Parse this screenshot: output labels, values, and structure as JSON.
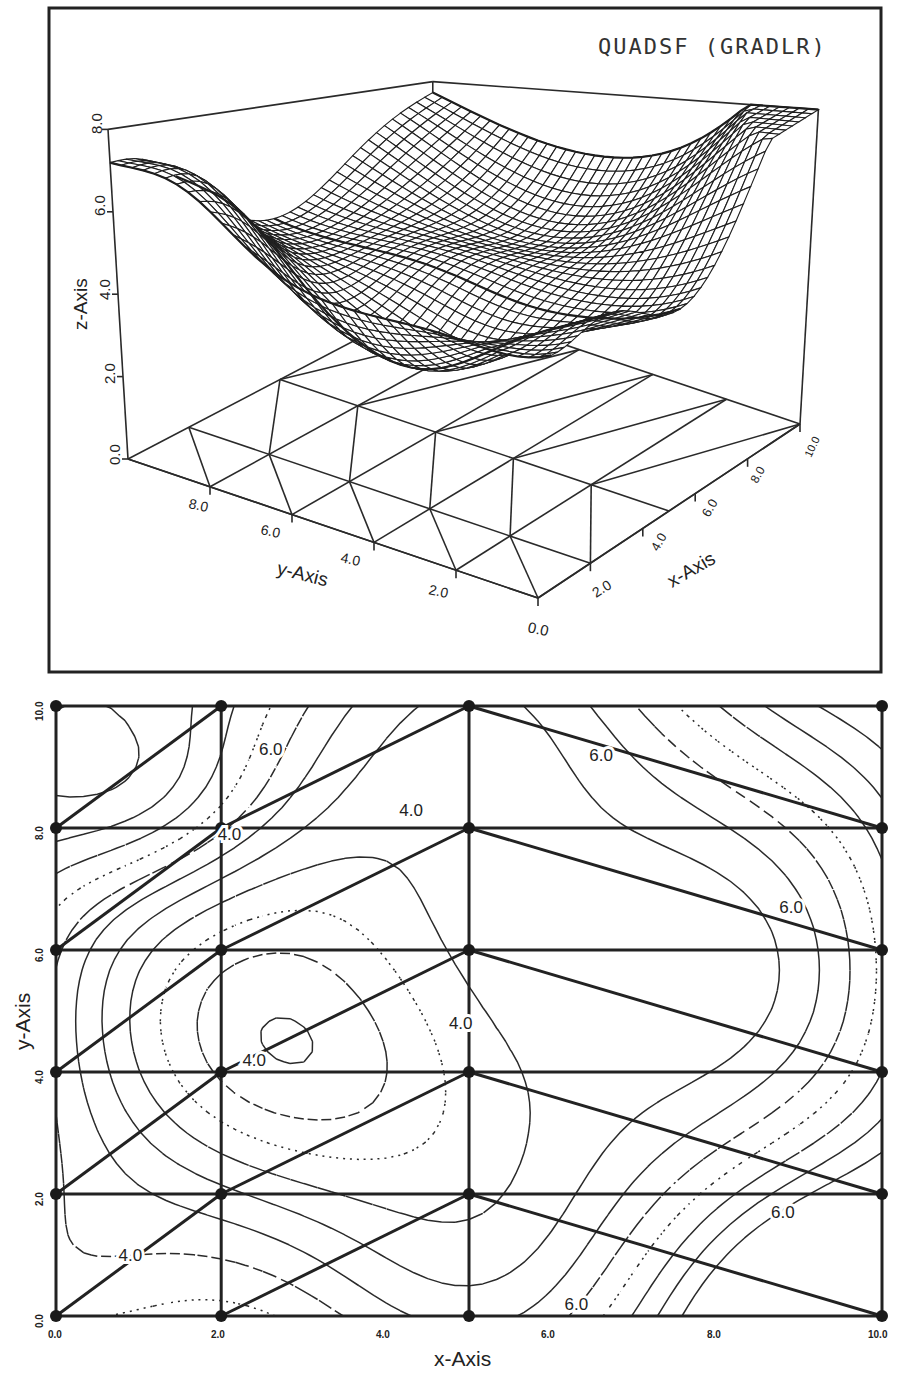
{
  "chart_data": [
    {
      "type": "surface3d",
      "title": "QUADSF (GRADLR)",
      "xlabel": "x-Axis",
      "ylabel": "y-Axis",
      "zlabel": "z-Axis",
      "xlim": [
        0,
        10
      ],
      "ylim": [
        0,
        10
      ],
      "zlim": [
        0,
        8
      ],
      "x_ticks": [
        "2.0",
        "4.0",
        "6.0",
        "8.0",
        "10.0"
      ],
      "y_ticks": [
        "0.0",
        "2.0",
        "4.0",
        "6.0",
        "8.0"
      ],
      "z_ticks": [
        "0.0",
        "2.0",
        "4.0",
        "6.0",
        "8.0"
      ],
      "mesh": "wireframe surface interpolated over triangulated scattered nodes; triangulation drawn on base plane z=0",
      "grid": false
    },
    {
      "type": "contour",
      "xlabel": "x-Axis",
      "ylabel": "y-Axis",
      "xlim": [
        0,
        10
      ],
      "ylim": [
        0,
        10
      ],
      "x_ticks": [
        "0.0",
        "2.0",
        "4.0",
        "6.0",
        "8.0",
        "10.0"
      ],
      "y_ticks": [
        "0.0",
        "2.0",
        "4.0",
        "6.0",
        "8.0",
        "10.0"
      ],
      "contour_labels": [
        {
          "text": "6.0",
          "x": 2.6,
          "y": 9.3
        },
        {
          "text": "4.0",
          "x": 4.3,
          "y": 8.3
        },
        {
          "text": "4.0",
          "x": 2.1,
          "y": 7.9
        },
        {
          "text": "6.0",
          "x": 6.6,
          "y": 9.2
        },
        {
          "text": "6.0",
          "x": 8.9,
          "y": 6.7
        },
        {
          "text": "4.0",
          "x": 4.9,
          "y": 4.8
        },
        {
          "text": "4.0",
          "x": 2.4,
          "y": 4.2
        },
        {
          "text": "6.0",
          "x": 8.8,
          "y": 1.7
        },
        {
          "text": "4.0",
          "x": 0.9,
          "y": 1.0
        },
        {
          "text": "6.0",
          "x": 6.3,
          "y": 0.2
        }
      ],
      "nodes": [
        [
          0,
          0
        ],
        [
          2,
          0
        ],
        [
          5,
          0
        ],
        [
          10,
          0
        ],
        [
          0,
          2
        ],
        [
          2,
          2
        ],
        [
          5,
          2
        ],
        [
          10,
          2
        ],
        [
          0,
          4
        ],
        [
          2,
          4
        ],
        [
          5,
          4
        ],
        [
          10,
          4
        ],
        [
          0,
          6
        ],
        [
          2,
          6
        ],
        [
          5,
          6
        ],
        [
          10,
          6
        ],
        [
          0,
          8
        ],
        [
          2,
          8
        ],
        [
          5,
          8
        ],
        [
          10,
          8
        ],
        [
          0,
          10
        ],
        [
          2,
          10
        ],
        [
          5,
          10
        ],
        [
          10,
          10
        ]
      ],
      "triangle_diagonals": [
        [
          [
            0,
            0
          ],
          [
            2,
            2
          ]
        ],
        [
          [
            2,
            0
          ],
          [
            5,
            2
          ]
        ],
        [
          [
            5,
            2
          ],
          [
            10,
            0
          ]
        ],
        [
          [
            0,
            2
          ],
          [
            2,
            4
          ]
        ],
        [
          [
            2,
            2
          ],
          [
            5,
            4
          ]
        ],
        [
          [
            5,
            4
          ],
          [
            10,
            2
          ]
        ],
        [
          [
            0,
            4
          ],
          [
            2,
            6
          ]
        ],
        [
          [
            2,
            4
          ],
          [
            5,
            6
          ]
        ],
        [
          [
            5,
            6
          ],
          [
            10,
            4
          ]
        ],
        [
          [
            0,
            6
          ],
          [
            2,
            8
          ]
        ],
        [
          [
            2,
            6
          ],
          [
            5,
            8
          ]
        ],
        [
          [
            5,
            8
          ],
          [
            10,
            6
          ]
        ],
        [
          [
            0,
            8
          ],
          [
            2,
            10
          ]
        ],
        [
          [
            2,
            8
          ],
          [
            5,
            10
          ]
        ],
        [
          [
            5,
            10
          ],
          [
            10,
            8
          ]
        ]
      ],
      "contour_levels_shown": [
        "4.0",
        "6.0"
      ],
      "line_styles": [
        "solid",
        "dashed",
        "dotted",
        "dash-dot",
        "long-dash"
      ]
    }
  ],
  "top_panel": {
    "title": "QUADSF (GRADLR)",
    "z_axis_label": "z-Axis",
    "y_axis_label": "y-Axis",
    "x_axis_label": "x-Axis",
    "z_ticks": [
      "0.0",
      "2.0",
      "4.0",
      "6.0",
      "8.0"
    ],
    "y_ticks": [
      "8.0",
      "6.0",
      "4.0",
      "2.0",
      "0.0"
    ],
    "x_ticks": [
      "2.0",
      "4.0",
      "6.0",
      "8.0",
      "10.0"
    ]
  },
  "bottom_panel": {
    "x_axis_label": "x-Axis",
    "y_axis_label": "y-Axis",
    "x_ticks": [
      "0.0",
      "2.0",
      "4.0",
      "6.0",
      "8.0",
      "10.0"
    ],
    "y_ticks": [
      "0.0",
      "2.0",
      "4.0",
      "6.0",
      "8.0",
      "10.0"
    ],
    "contour_labels": [
      "6.0",
      "4.0",
      "4.0",
      "6.0",
      "6.0",
      "4.0",
      "4.0",
      "6.0",
      "4.0",
      "6.0"
    ]
  },
  "colors": {
    "ink": "#1a1a1a",
    "paper": "#ffffff"
  }
}
